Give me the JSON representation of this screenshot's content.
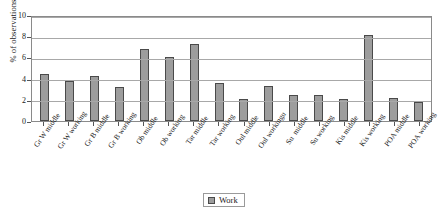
{
  "chart_data": {
    "type": "bar",
    "title": "",
    "xlabel": "",
    "ylabel": "% of observations",
    "ylim": [
      0,
      10
    ],
    "yticks": [
      0,
      2,
      4,
      6,
      8,
      10
    ],
    "grid": true,
    "legend_position": "bottom-center",
    "categories": [
      "Gr W middle",
      "Gr W working",
      "Gr B middle",
      "Gr B working",
      "Ob middle",
      "Ob working",
      "Tar middle",
      "Tar working",
      "Oul middle",
      "Oul workingu",
      "Su  middle",
      "Su working",
      "Kis middle",
      "Kis working",
      "POA middle",
      "POA working"
    ],
    "series": [
      {
        "name": "Work",
        "color": "#9d9d9d",
        "values": [
          4.4,
          3.8,
          4.25,
          3.2,
          6.75,
          6.0,
          7.25,
          3.6,
          2.1,
          3.35,
          2.5,
          2.45,
          2.05,
          8.15,
          2.2,
          1.75
        ]
      }
    ]
  },
  "legend": {
    "items": [
      {
        "label": "Work"
      }
    ]
  }
}
